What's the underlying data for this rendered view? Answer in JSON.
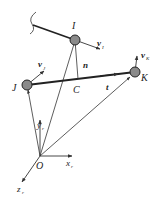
{
  "diagram": {
    "points": {
      "I": {
        "label": "I",
        "x": 75,
        "y": 40
      },
      "J": {
        "label": "J",
        "x": 27,
        "y": 85
      },
      "K": {
        "label": "K",
        "x": 135,
        "y": 72
      },
      "C": {
        "label": "C",
        "x": 78,
        "y": 80
      },
      "O": {
        "label": "O",
        "x": 40,
        "y": 156
      }
    },
    "vectors": {
      "vI": {
        "label": "v",
        "sub": "I"
      },
      "vJ": {
        "label": "v",
        "sub": "J"
      },
      "vK": {
        "label": "v",
        "sub": "K"
      },
      "n": {
        "label": "n"
      },
      "t": {
        "label": "t"
      }
    },
    "axes": {
      "x": {
        "label": "x",
        "sub": "r"
      },
      "y": {
        "label": "y",
        "sub": "r"
      },
      "z": {
        "label": "z",
        "sub": "r"
      }
    },
    "colors": {
      "line": "#333333",
      "ball_fill": "#8a8a8a",
      "ball_stroke": "#222222"
    }
  }
}
